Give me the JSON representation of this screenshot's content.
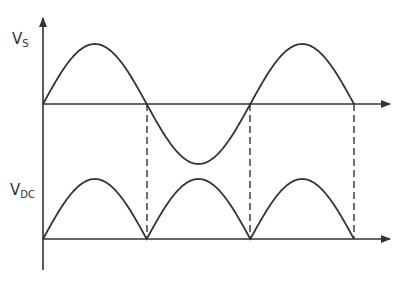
{
  "labels": {
    "vs_main": "V",
    "vs_sub": "S",
    "vdc_main": "V",
    "vdc_sub": "DC"
  },
  "colors": {
    "stroke": "#333333",
    "background": "#ffffff"
  },
  "geometry": {
    "y_axis_x": 43,
    "y_axis_top": 16,
    "y_axis_bottom": 270,
    "upper_axis_y": 104,
    "lower_axis_y": 239,
    "x_end": 392,
    "zero_crossings_x": [
      43,
      147,
      250,
      354
    ],
    "amplitude_upper": 60,
    "amplitude_lower": 60
  },
  "panels": [
    {
      "name": "input-ac-voltage",
      "label": "Vs",
      "waveform": "sine",
      "cycles": 1.5
    },
    {
      "name": "output-dc-voltage",
      "label": "VDC",
      "waveform": "full-wave rectified sine",
      "humps": 3
    }
  ]
}
